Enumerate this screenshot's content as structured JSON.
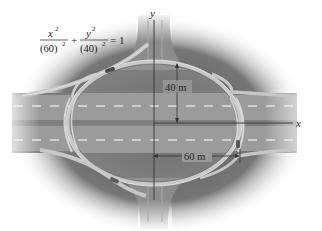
{
  "figure": {
    "type": "elliptical highway interchange diagram",
    "equation": {
      "term1_numerator": "x",
      "term1_numerator_exp": "2",
      "term1_denominator": "(60)",
      "term1_denominator_exp": "2",
      "plus": "+",
      "term2_numerator": "y",
      "term2_numerator_exp": "2",
      "term2_denominator": "(40)",
      "term2_denominator_exp": "2",
      "equals": "= 1"
    },
    "axes": {
      "x_label": "x",
      "y_label": "y"
    },
    "dimensions": {
      "vertical_semi_axis": "40 m",
      "horizontal_semi_axis": "60 m"
    },
    "colors": {
      "shadow": "#5a5a5a",
      "road": "#9a9a9a",
      "road_dark": "#7d7d7d",
      "lane_marker": "#d8d8d8",
      "ramp": "#c4c4c4",
      "ramp_edge": "#e6e6e6",
      "axis": "#333333",
      "background": "#ffffff"
    }
  }
}
